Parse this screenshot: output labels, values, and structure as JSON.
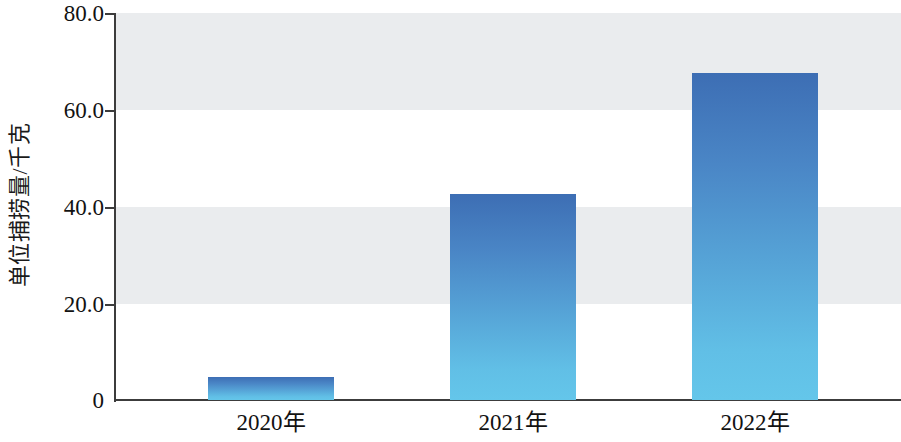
{
  "chart_data": {
    "type": "bar",
    "title": "",
    "xlabel": "",
    "ylabel": "单位捕捞量/千克",
    "categories": [
      "2020年",
      "2021年",
      "2022年"
    ],
    "values": [
      4.8,
      42.5,
      67.7
    ],
    "ylim": [
      0,
      80
    ],
    "yticks": [
      0,
      20,
      40,
      60,
      80
    ],
    "ytick_labels": [
      "0",
      "20.0",
      "40.0",
      "60.0",
      "80.0"
    ],
    "grid": false,
    "alternating_bands": true,
    "band_color": "#eaecee",
    "legend": null,
    "bar_gradient_top": "#3d6eb4",
    "bar_gradient_bottom": "#64c6ea",
    "axis_color": "#3c3c3c"
  },
  "axis": {
    "y_title": "单位捕捞量/千克",
    "y_ticks": [
      {
        "label": "80.0",
        "value": 80
      },
      {
        "label": "60.0",
        "value": 60
      },
      {
        "label": "40.0",
        "value": 40
      },
      {
        "label": "20.0",
        "value": 20
      },
      {
        "label": "0",
        "value": 0
      }
    ],
    "x_ticks": [
      {
        "label": "2020年"
      },
      {
        "label": "2021年"
      },
      {
        "label": "2022年"
      }
    ]
  }
}
